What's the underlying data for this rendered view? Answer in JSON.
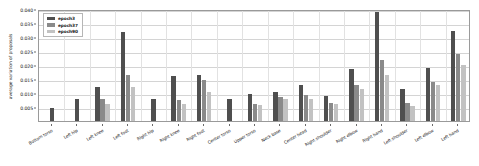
{
  "chart_data": {
    "type": "bar",
    "title": "",
    "xlabel": "",
    "ylabel": "average variation of proposals",
    "ylim": [
      0.0,
      0.04
    ],
    "ytick_labels": [
      "0.040",
      "0.035",
      "0.030",
      "0.025",
      "0.020",
      "0.015",
      "0.010",
      "0.005"
    ],
    "ytick_values": [
      0.04,
      0.035,
      0.03,
      0.025,
      0.02,
      0.015,
      0.01,
      0.005
    ],
    "grid": true,
    "legend_position": "upper-left",
    "categories": [
      "Bottom torso",
      "Left hip",
      "Left knee",
      "Left foot",
      "Right hip",
      "Right knee",
      "Right foot",
      "Center torso",
      "Upper torso",
      "Neck base",
      "Center head",
      "Right shoulder",
      "Right elbow",
      "Right hand",
      "Left shoulder",
      "Left elbow",
      "Left hand"
    ],
    "series": [
      {
        "name": "epoch3",
        "color": "#4f4f4f",
        "values": [
          0.0048,
          0.0077,
          0.0122,
          0.0317,
          0.0077,
          0.016,
          0.0163,
          0.0078,
          0.0095,
          0.0105,
          0.0128,
          0.0088,
          0.0185,
          0.0389,
          0.0113,
          0.019,
          0.032
        ]
      },
      {
        "name": "epoch37",
        "color": "#8a8a8a",
        "values": [
          0.0,
          0.0,
          0.008,
          0.0163,
          0.0,
          0.0074,
          0.0148,
          0.0,
          0.0062,
          0.0085,
          0.0092,
          0.0065,
          0.0128,
          0.0219,
          0.0066,
          0.0138,
          0.024
        ]
      },
      {
        "name": "epoch90",
        "color": "#c2c2c2",
        "values": [
          0.0,
          0.0,
          0.0061,
          0.012,
          0.0,
          0.0061,
          0.0104,
          0.0,
          0.0058,
          0.008,
          0.008,
          0.006,
          0.0113,
          0.0166,
          0.0053,
          0.0129,
          0.0199
        ]
      }
    ]
  },
  "legend": {
    "entries": [
      {
        "label": "epoch3"
      },
      {
        "label": "epoch37"
      },
      {
        "label": "epoch90"
      }
    ]
  }
}
